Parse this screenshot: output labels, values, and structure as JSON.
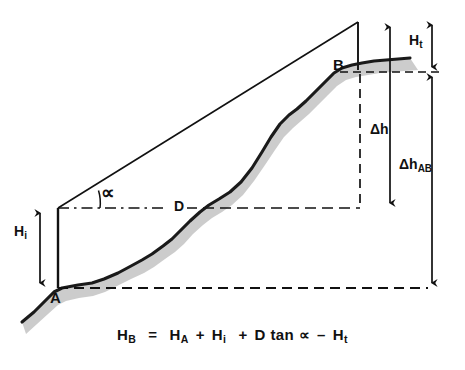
{
  "diagram": {
    "type": "surveying-cross-section",
    "points": [
      {
        "id": "A",
        "label": "A",
        "x": 55,
        "y": 296,
        "role": "instrument-station-ground-point"
      },
      {
        "id": "B",
        "label": "B",
        "x": 339,
        "y": 65,
        "role": "target-point-on-terrain"
      }
    ],
    "dimensions": [
      {
        "id": "Hi",
        "label": "H",
        "sub": "i",
        "x": 18,
        "y": 232,
        "meaning": "instrument height above point A"
      },
      {
        "id": "D",
        "label": "D",
        "x": 176,
        "y": 200,
        "meaning": "horizontal distance"
      },
      {
        "id": "alpha",
        "label": "∝",
        "x": 104,
        "y": 188,
        "meaning": "vertical angle of sight"
      },
      {
        "id": "dh",
        "label": "Δh",
        "x": 376,
        "y": 123,
        "meaning": "vertical rise over distance D"
      },
      {
        "id": "dhAB",
        "label": "Δh",
        "sub": "AB",
        "x": 404,
        "y": 158,
        "meaning": "height difference between A and B"
      },
      {
        "id": "Ht",
        "label": "H",
        "sub": "t",
        "x": 411,
        "y": 32,
        "meaning": "target / reflector height above B"
      }
    ],
    "formula": {
      "lhs": "H",
      "lhs_sub": "B",
      "equals": "=",
      "terms": [
        {
          "sym": "H",
          "sub": "A",
          "op": ""
        },
        {
          "sym": "H",
          "sub": "i",
          "op": "+"
        },
        {
          "sym": "D tan ∝",
          "sub": "",
          "op": "+"
        },
        {
          "sym": "H",
          "sub": "t",
          "op": "–"
        }
      ],
      "plain": "H_B = H_A + H_i + D tan ∝ – H_t"
    },
    "colors": {
      "line": "#111111",
      "terrain": "#1a1a1a",
      "shade": "#c9c9c9",
      "background": "#ffffff"
    },
    "geometry": {
      "terrain_path": "M 22,322 L 34,312 L 45,301 L 54,292 L 62,288 L 78,285 L 92,283 L 104,279 L 118,273 L 131,266 L 142,260 L 152,254 L 163,246 L 172,239 L 180,231 L 190,221 L 200,212 L 209,205 L 219,199 L 230,192 L 241,182 L 252,168 L 262,152 L 271,137 L 280,124 L 289,115 L 297,109 L 306,101 L 315,92 L 325,82 L 334,73 L 342,68 L 352,65 L 362,63 L 374,61 L 386,60 L 398,59 L 410,58",
      "shade_offset": {
        "dx": 14,
        "dy": 12
      },
      "sight_line": {
        "x1": 58,
        "y1": 208,
        "x2": 358,
        "y2": 22
      },
      "vertical_AP": {
        "x": 58,
        "y1": 208,
        "y2": 288
      },
      "vertical_top_right": {
        "x": 358,
        "y1": 22,
        "y2": 68
      },
      "horizontal_D": {
        "x1": 58,
        "y1": 208,
        "x2": 360,
        "y2": 208
      },
      "vertical_B_dashed": {
        "x": 360,
        "y1": 72,
        "y2": 208
      },
      "baseline_A_dashed": {
        "x1": 58,
        "y1": 288,
        "x2": 432,
        "y2": 288
      },
      "B_level_dashed": {
        "x1": 360,
        "y1": 72,
        "x2": 440,
        "y2": 72
      },
      "arrow_Hi": {
        "x": 40,
        "y1": 208,
        "y2": 288
      },
      "arrow_dh": {
        "x": 390,
        "y1": 22,
        "y2": 208
      },
      "arrow_dhAB": {
        "x": 432,
        "y1": 72,
        "y2": 288
      },
      "arrow_Ht": {
        "x": 432,
        "y1": 20,
        "y2": 72
      }
    }
  }
}
